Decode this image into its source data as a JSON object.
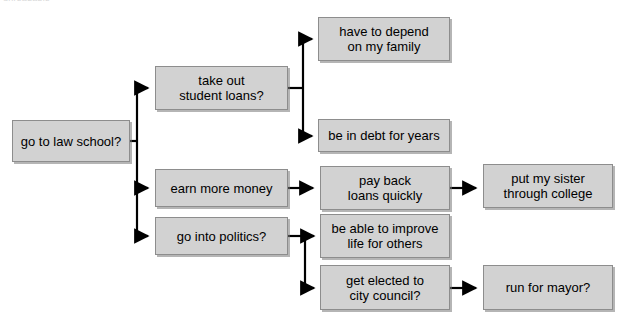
{
  "caption": {
    "text": "unreadable"
  },
  "colors": {
    "node_fill": "#d2d2d2",
    "node_border": "#8d8d8d",
    "connector": "#000000",
    "background": "#ffffff",
    "text": "#000000"
  },
  "diagram": {
    "type": "decision-tree-flowchart",
    "orientation": "left-to-right",
    "nodes": [
      {
        "id": "root",
        "label": "go to law school?",
        "x": 12,
        "y": 120,
        "w": 118,
        "h": 42
      },
      {
        "id": "loans",
        "label": "take out\nstudent loans?",
        "x": 155,
        "y": 66,
        "w": 133,
        "h": 44
      },
      {
        "id": "money",
        "label": "earn more money",
        "x": 155,
        "y": 169,
        "w": 133,
        "h": 38
      },
      {
        "id": "politics",
        "label": "go into politics?",
        "x": 155,
        "y": 217,
        "w": 133,
        "h": 38
      },
      {
        "id": "depend",
        "label": "have to depend\non my family",
        "x": 318,
        "y": 17,
        "w": 132,
        "h": 44
      },
      {
        "id": "debt",
        "label": "be in debt for years",
        "x": 318,
        "y": 119,
        "w": 132,
        "h": 33
      },
      {
        "id": "payback",
        "label": "pay back\nloans quickly",
        "x": 320,
        "y": 166,
        "w": 130,
        "h": 44
      },
      {
        "id": "improve",
        "label": "be able to improve\nlife for others",
        "x": 320,
        "y": 214,
        "w": 130,
        "h": 44
      },
      {
        "id": "elected",
        "label": "get elected to\ncity council?",
        "x": 320,
        "y": 265,
        "w": 130,
        "h": 45
      },
      {
        "id": "sister",
        "label": "put my sister\nthrough college",
        "x": 483,
        "y": 164,
        "w": 130,
        "h": 44
      },
      {
        "id": "mayor",
        "label": "run for mayor?",
        "x": 483,
        "y": 265,
        "w": 130,
        "h": 45
      }
    ],
    "edges": [
      {
        "from": "root",
        "to": "loans"
      },
      {
        "from": "root",
        "to": "money"
      },
      {
        "from": "root",
        "to": "politics"
      },
      {
        "from": "loans",
        "to": "depend"
      },
      {
        "from": "loans",
        "to": "debt"
      },
      {
        "from": "money",
        "to": "payback"
      },
      {
        "from": "politics",
        "to": "improve"
      },
      {
        "from": "politics",
        "to": "elected"
      },
      {
        "from": "payback",
        "to": "sister"
      },
      {
        "from": "elected",
        "to": "mayor"
      }
    ]
  }
}
